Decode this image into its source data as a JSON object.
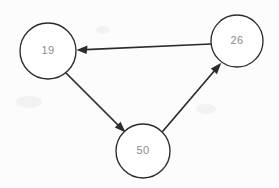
{
  "diagram": {
    "background_color": "#fcfcfc",
    "node_stroke_color": "#2b2b2b",
    "node_fill_color": "#ffffff",
    "label_color": "#8c8c8c",
    "edge_color": "#2b2b2b",
    "nodes": [
      {
        "id": "node-19",
        "label": "19",
        "cx": 48,
        "cy": 51,
        "r": 28
      },
      {
        "id": "node-26",
        "label": "26",
        "cx": 237,
        "cy": 41,
        "r": 26
      },
      {
        "id": "node-50",
        "label": "50",
        "cx": 143,
        "cy": 151,
        "r": 27
      }
    ],
    "edges": [
      {
        "id": "edge-26-to-19",
        "from": "26",
        "to": "19",
        "directed": true,
        "x1": 211,
        "y1": 44,
        "x2": 77,
        "y2": 50
      },
      {
        "id": "edge-19-to-50",
        "from": "19",
        "to": "50",
        "directed": true,
        "x1": 66,
        "y1": 73,
        "x2": 125,
        "y2": 132
      },
      {
        "id": "edge-50-to-26",
        "from": "50",
        "to": "26",
        "directed": true,
        "x1": 163,
        "y1": 131,
        "x2": 221,
        "y2": 63
      }
    ],
    "cycle_description": "19 to 50 to 26 to 19"
  }
}
